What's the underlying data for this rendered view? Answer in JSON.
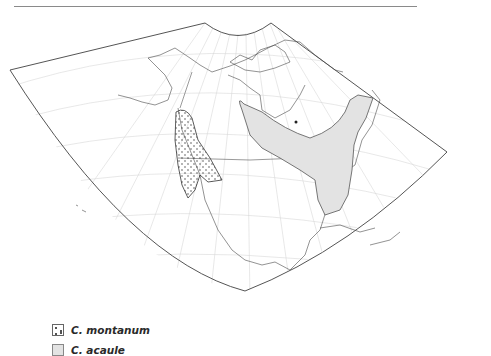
{
  "map": {
    "projection": "conic",
    "region": "North America",
    "colors": {
      "frame": "#555555",
      "graticule": "#d8d8d8",
      "coast": "#4a4a4a",
      "acaule_fill": "#e3e3e3",
      "montanum_dots": "#333333"
    }
  },
  "legend": {
    "items": [
      {
        "symbol": "dotted-pattern",
        "label": "C. montanum"
      },
      {
        "symbol": "gray-fill",
        "label": "C. acaule"
      }
    ]
  }
}
